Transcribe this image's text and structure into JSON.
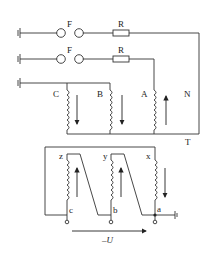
{
  "diagram": {
    "type": "transformer connection circuit",
    "fuse_label": "F",
    "resistor_label": "R",
    "primary_windings": [
      "C",
      "B",
      "A"
    ],
    "neutral_label": "N",
    "transformer_label": "T",
    "secondary_top_terminals": [
      "z",
      "y",
      "x"
    ],
    "secondary_bottom_terminals": [
      "c",
      "b",
      "a"
    ],
    "voltage_label": "–U",
    "colors": {
      "line": "#333333",
      "background": "#ffffff"
    }
  }
}
